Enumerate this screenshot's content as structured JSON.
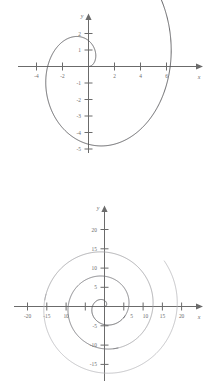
{
  "page": {
    "background": "#ffffff",
    "curve_color_dark": "#57575a",
    "curve_color_light": "#9a9a9e",
    "axis_color": "#6b6b6b"
  },
  "figures": [
    {
      "id": "figure-top",
      "axis_label_x": "x",
      "axis_label_y": "y",
      "x_ticks": [
        "-4",
        "-2",
        "2",
        "4",
        "6"
      ],
      "y_ticks": [
        "2",
        "1",
        "-1",
        "-2",
        "-3",
        "-4",
        "-5"
      ]
    },
    {
      "id": "figure-bottom",
      "axis_label_x": "x",
      "axis_label_y": "y",
      "x_ticks": [
        "-20",
        "-15",
        "10",
        "5",
        "10",
        "15",
        "20"
      ],
      "y_ticks": [
        "20",
        "15",
        "10",
        "5",
        "-5",
        "-10",
        "-15"
      ]
    }
  ],
  "chart_data": [
    {
      "type": "line",
      "id": "figure-top",
      "title": "",
      "subtitle": "",
      "plot_kind": "polar-spiral",
      "polar_equation": "r = theta",
      "theta_start": 0.0,
      "theta_end": 7.1,
      "theta_units": "radians",
      "xlabel": "x",
      "ylabel": "y",
      "xlim": [
        -5.0,
        7.0
      ],
      "ylim": [
        -5.6,
        2.6
      ],
      "xticks": [
        -4,
        -2,
        2,
        4,
        6
      ],
      "yticks": [
        2,
        1,
        -1,
        -2,
        -3,
        -4,
        -5
      ],
      "xtick_labels": [
        "-4",
        "-2",
        "2",
        "4",
        "6"
      ],
      "ytick_labels": [
        "2",
        "1",
        "-1",
        "-2",
        "-3",
        "-4",
        "-5"
      ],
      "grid": false,
      "legend": "none",
      "series": [
        {
          "name": "r = theta",
          "color": "#57575a",
          "x": [
            0.0,
            0.147,
            0.271,
            0.346,
            0.345,
            0.25,
            0.055,
            -0.236,
            -0.607,
            -1.03,
            -1.469,
            -1.878,
            -2.21,
            -2.418,
            -2.463,
            -2.317,
            -1.968,
            -1.42,
            -0.696,
            0.163,
            1.1,
            2.048,
            2.931,
            3.675,
            4.21,
            4.481,
            4.453,
            4.116,
            3.489,
            2.62,
            1.584,
            0.474,
            -0.61,
            -1.574,
            -2.33,
            -2.808,
            -2.961,
            -2.773,
            -2.262,
            -1.478,
            -0.505,
            0.547,
            1.553,
            2.391,
            2.958,
            3.183,
            3.035,
            2.535,
            1.75,
            0.79,
            -0.21,
            -1.121,
            -1.826,
            -2.235,
            -2.3,
            -2.023,
            -1.457,
            -0.7,
            0.128,
            0.896,
            1.483,
            1.804,
            1.82,
            1.54,
            1.023,
            0.363,
            -0.328,
            -0.933,
            -1.352,
            -1.522,
            -1.42,
            -1.069,
            -0.535,
            0.076,
            0.639,
            1.04,
            1.201,
            1.098,
            0.763,
            0.277,
            -0.25,
            -0.695,
            -0.95,
            -0.947,
            -0.687,
            -0.239,
            0.28,
            0.724,
            0.958,
            0.906,
            0.584,
            0.095,
            -0.41,
            -0.74,
            -0.77,
            -0.496,
            -0.037,
            0.424,
            0.685,
            0.627,
            0.29,
            -0.153,
            -0.48,
            -0.528,
            -0.28,
            0.118,
            0.42,
            0.44,
            0.182,
            -0.163,
            -0.35,
            -0.266,
            0.02,
            0.25,
            0.22,
            -0.02,
            -0.17,
            -0.08,
            0.09,
            0.1,
            -0.03,
            -0.05,
            0.0
          ],
          "y": [
            0.0,
            0.015,
            0.088,
            0.213,
            0.38,
            0.571,
            0.765,
            0.938,
            1.068,
            1.136,
            1.128,
            1.036,
            0.86,
            0.605,
            0.285,
            -0.08,
            -0.472,
            -0.866,
            -1.237,
            -1.558,
            -1.8,
            -1.94,
            -1.957,
            -1.834,
            -1.563,
            -1.143,
            -0.585,
            0.09,
            0.849,
            1.651,
            2.447,
            3.187,
            3.818,
            4.291,
            4.566,
            4.608,
            4.397,
            3.928,
            3.212,
            2.279,
            1.176,
            -0.034,
            -1.28,
            -2.478,
            -3.545,
            -4.4,
            -4.977,
            -5.225,
            -5.117,
            -4.654,
            -3.865,
            -2.808,
            -1.562,
            -0.222,
            1.11,
            2.33,
            3.339,
            4.055,
            4.42,
            4.408,
            4.027,
            3.318,
            2.354,
            1.228,
            0.049,
            -1.07,
            -2.02,
            -2.707,
            -3.06,
            -3.046,
            -2.666,
            -1.967,
            -1.03,
            0.032,
            1.08,
            1.977,
            2.608,
            2.89,
            2.782,
            2.3,
            1.519,
            0.553,
            -0.463,
            -1.392,
            -2.11,
            -2.52,
            -2.565,
            -2.24,
            -1.597,
            -0.73,
            0.232,
            1.14,
            1.852,
            2.26,
            2.31,
            2.0,
            1.39,
            0.59,
            -0.28,
            -1.06,
            -1.6,
            -1.81,
            -1.66,
            -1.2,
            -0.55,
            0.18,
            0.83,
            1.26,
            1.36,
            1.13,
            0.64,
            0.03,
            -0.56,
            -0.94,
            -1.0,
            -0.73,
            -0.25,
            0.28,
            0.67,
            0.8,
            0.6,
            0.2,
            -0.2,
            0.0
          ]
        }
      ]
    },
    {
      "type": "line",
      "id": "figure-bottom",
      "title": "",
      "subtitle": "",
      "plot_kind": "polar-spiral",
      "polar_equation": "r = theta",
      "theta_start": 0.0,
      "theta_end": 19.5,
      "theta_units": "radians",
      "xlabel": "x",
      "ylabel": "y",
      "xlim": [
        -23,
        23
      ],
      "ylim": [
        -18,
        22
      ],
      "xticks": [
        -20,
        -15,
        -10,
        -5,
        5,
        10,
        15,
        20
      ],
      "yticks": [
        20,
        15,
        10,
        5,
        -5,
        -10,
        -15
      ],
      "xtick_labels": [
        "-20",
        "-15",
        "10",
        "5",
        "10",
        "15",
        "20"
      ],
      "ytick_labels": [
        "20",
        "15",
        "10",
        "5",
        "-5",
        "-10",
        "-15"
      ],
      "grid": false,
      "legend": "none",
      "turns": 3,
      "max_radius": 19.5,
      "series": [
        {
          "name": "r = theta (3 turns)",
          "color": "#57575a",
          "description": "Archimedean spiral starting at origin, radius grows linearly with angle up to about 19.5 units after roughly three full revolutions"
        }
      ]
    }
  ]
}
